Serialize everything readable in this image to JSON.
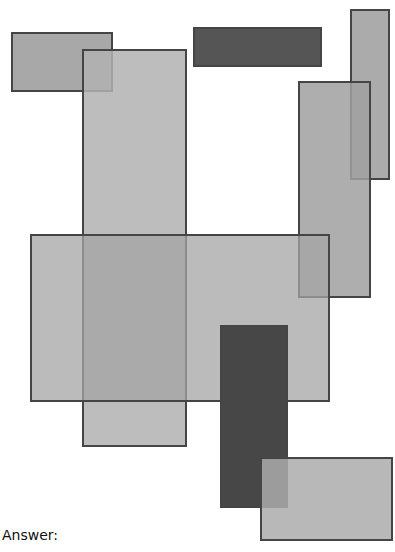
{
  "diagram": {
    "rects": [
      {
        "id": "r1",
        "x": 11,
        "y": 32,
        "w": 102,
        "h": 60,
        "fill": "#a8a8a8"
      },
      {
        "id": "r3",
        "x": 193,
        "y": 27,
        "w": 129,
        "h": 40,
        "fill": "#555555"
      },
      {
        "id": "r2",
        "x": 82,
        "y": 49,
        "w": 105,
        "h": 398,
        "fill": "#b2b2b2",
        "alpha": 0.85
      },
      {
        "id": "r4",
        "x": 350,
        "y": 9,
        "w": 40,
        "h": 171,
        "fill": "#ababab"
      },
      {
        "id": "r5",
        "x": 298,
        "y": 81,
        "w": 73,
        "h": 217,
        "fill": "#a0a0a0",
        "alpha": 0.85
      },
      {
        "id": "r6",
        "x": 30,
        "y": 234,
        "w": 300,
        "h": 168,
        "fill": "#a4a4a4",
        "alpha": 0.75
      },
      {
        "id": "r7",
        "x": 220,
        "y": 325,
        "w": 68,
        "h": 183,
        "fill": "#474747"
      },
      {
        "id": "r8",
        "x": 260,
        "y": 457,
        "w": 133,
        "h": 84,
        "fill": "#ababab",
        "alpha": 0.85
      }
    ]
  },
  "footer": {
    "answer_label": "Answer:"
  }
}
